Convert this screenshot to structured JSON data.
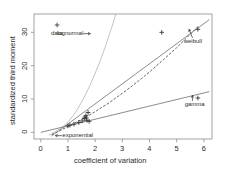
{
  "chart_data": {
    "type": "scatter",
    "title": "",
    "xlabel": "coefficient of variation",
    "ylabel": "standardized third moment",
    "xlim": [
      -0.25,
      6.3
    ],
    "ylim": [
      -2.0,
      35.5
    ],
    "xticks": [
      0,
      1,
      2,
      3,
      4,
      5,
      6
    ],
    "xticklabels": [
      "0",
      "1",
      "2",
      "3",
      "4",
      "5",
      "6"
    ],
    "yticks": [
      0,
      10,
      20,
      30
    ],
    "yticklabels": [
      "0",
      "10",
      "20",
      "30"
    ],
    "grid": false,
    "legend_position": "inline-annotations",
    "series": [
      {
        "name": "data",
        "type": "scatter",
        "marker": "plus",
        "color": "#3a3a3a",
        "points": [
          {
            "x": 0.6,
            "y": 32.2
          },
          {
            "x": 4.45,
            "y": 30.0
          },
          {
            "x": 5.78,
            "y": 10.3
          },
          {
            "x": 5.78,
            "y": 30.9
          },
          {
            "x": 1.0,
            "y": 1.95
          },
          {
            "x": 1.07,
            "y": 2.15
          },
          {
            "x": 1.22,
            "y": 2.45
          },
          {
            "x": 1.4,
            "y": 2.95
          },
          {
            "x": 1.52,
            "y": 3.4
          },
          {
            "x": 1.6,
            "y": 4.1
          },
          {
            "x": 1.62,
            "y": 4.55
          },
          {
            "x": 1.66,
            "y": 5.0
          },
          {
            "x": 1.68,
            "y": 4.3
          },
          {
            "x": 1.7,
            "y": 3.6
          },
          {
            "x": 1.74,
            "y": 5.95
          },
          {
            "x": 1.78,
            "y": 3.3
          }
        ]
      },
      {
        "name": "lognormal",
        "type": "line",
        "style": "solid",
        "color": "#b4b4b4",
        "points": [
          {
            "x": 0.3,
            "y": -0.9
          },
          {
            "x": 0.5,
            "y": 0.1
          },
          {
            "x": 0.8,
            "y": 1.6
          },
          {
            "x": 1.0,
            "y": 3.1
          },
          {
            "x": 1.2,
            "y": 5.1
          },
          {
            "x": 1.4,
            "y": 7.6
          },
          {
            "x": 1.6,
            "y": 10.6
          },
          {
            "x": 1.8,
            "y": 13.9
          },
          {
            "x": 2.0,
            "y": 17.7
          },
          {
            "x": 2.2,
            "y": 21.8
          },
          {
            "x": 2.4,
            "y": 26.3
          },
          {
            "x": 2.6,
            "y": 31.2
          },
          {
            "x": 2.76,
            "y": 35.5
          }
        ]
      },
      {
        "name": "weibull",
        "type": "line",
        "style": "dashed",
        "color": "#3c3c3c",
        "points": [
          {
            "x": 0.4,
            "y": -0.7
          },
          {
            "x": 0.8,
            "y": 0.9
          },
          {
            "x": 1.2,
            "y": 2.6
          },
          {
            "x": 1.6,
            "y": 4.3
          },
          {
            "x": 2.0,
            "y": 6.2
          },
          {
            "x": 2.5,
            "y": 8.8
          },
          {
            "x": 3.0,
            "y": 11.7
          },
          {
            "x": 3.5,
            "y": 14.8
          },
          {
            "x": 4.0,
            "y": 18.1
          },
          {
            "x": 4.5,
            "y": 21.7
          },
          {
            "x": 5.0,
            "y": 25.4
          },
          {
            "x": 5.4,
            "y": 28.6
          },
          {
            "x": 5.8,
            "y": 31.9
          }
        ]
      },
      {
        "name": "gamma",
        "type": "line",
        "style": "solid",
        "color": "#6e6e6e",
        "points": [
          {
            "x": 0.0,
            "y": 0.0
          },
          {
            "x": 6.2,
            "y": 12.2
          }
        ]
      },
      {
        "name": "upper-envelope",
        "type": "line",
        "style": "solid",
        "color": "#6e6e6e",
        "points": [
          {
            "x": 0.4,
            "y": -1.1
          },
          {
            "x": 6.2,
            "y": 33.8
          }
        ]
      }
    ],
    "annotations": [
      {
        "label": "data",
        "x": 0.6,
        "y": 29.6,
        "arrow": "none"
      },
      {
        "label": "lognormal",
        "x": 1.62,
        "y": 29.6,
        "arrow": "right"
      },
      {
        "label": "weibull",
        "x": 5.62,
        "y": 27.3,
        "arrow": "up-left"
      },
      {
        "label": "gamma",
        "x": 5.58,
        "y": 8.4,
        "arrow": "up"
      },
      {
        "label": "exponential",
        "x": 0.72,
        "y": -1.0,
        "arrow": "left"
      }
    ]
  },
  "colors": {
    "background": "#ffffff",
    "frame": "#8c8c8c",
    "text": "#2b2b2b",
    "lognormal": "#b4b4b4",
    "weibull": "#3c3c3c",
    "gamma": "#6e6e6e",
    "marker": "#3a3a3a"
  }
}
